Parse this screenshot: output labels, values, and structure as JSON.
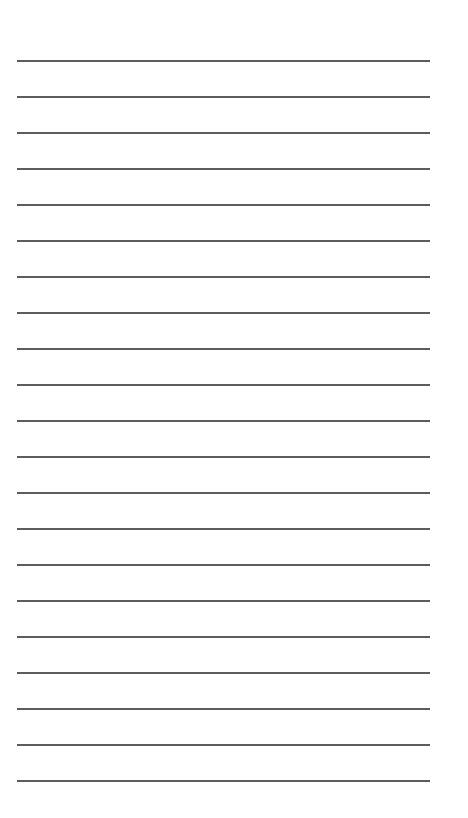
{
  "page": {
    "type": "lined-paper",
    "background_color": "#ffffff",
    "line_color": "#4a4a4a",
    "line_count": 21,
    "first_line_y": 60,
    "line_spacing": 36,
    "line_left": 17,
    "line_width": 413,
    "line_thickness": 2
  }
}
